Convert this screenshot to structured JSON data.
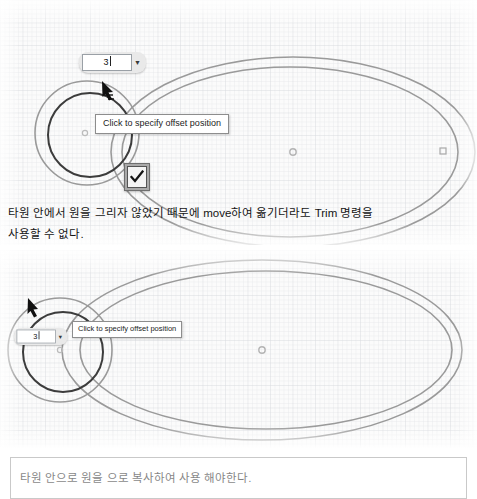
{
  "document": {
    "title": "CAD offset command tutorial capture"
  },
  "top_panel": {
    "offset_input": {
      "value": "3",
      "dropdown_icon": "chevron-down-icon"
    },
    "tooltip": "Click to specify offset position",
    "confirm_button": {
      "icon": "check-icon",
      "label": "OK"
    },
    "geometry": {
      "ellipse_center_marker": "center-point-marker",
      "ellipse_grip_marker": "quadrant-grip-marker",
      "circle_center_marker": "center-point-marker",
      "cursor": "crosshair-cursor"
    }
  },
  "caption": {
    "line1": "타원 안에서 원을 그리자 않았기 때문에 move하여 옮기더라도 Trim 명령을",
    "line2": "사용할 수 없다."
  },
  "bottom_panel": {
    "offset_input": {
      "value": "3",
      "dropdown_icon": "chevron-down-icon"
    },
    "tooltip": "Click to specify offset position",
    "geometry": {
      "ellipse_center_marker": "center-point-marker",
      "cursor": "crosshair-cursor"
    }
  },
  "note_box": {
    "text": "타원 안으로 원을 으로 복사하여 사용 해야한다."
  },
  "colors": {
    "canvas_background": "#fbfbfb",
    "grid_line": "#cdd0d4",
    "geometry_line": "#9a9a9a",
    "geometry_line_dark": "#3c3c3c",
    "tooltip_background": "#ffffff",
    "tooltip_border": "#8d8d8d",
    "widget_background": "#e9e9e9",
    "check_button_background": "#a9a9a9"
  }
}
